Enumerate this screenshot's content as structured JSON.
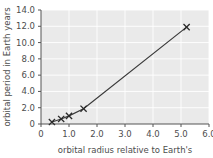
{
  "chart_data": {
    "type": "line",
    "title": "",
    "xlabel": "orbital radius relative to Earth's",
    "ylabel": "orbital period in Earth years",
    "xlim": [
      0,
      6.0
    ],
    "ylim": [
      0,
      14.0
    ],
    "grid": true,
    "legend": "none",
    "marker": "x",
    "x_ticks": [
      0,
      1.0,
      2.0,
      3.0,
      4.0,
      5.0,
      6.0
    ],
    "x_tick_labels": [
      "0",
      "1.0",
      "2.0",
      "3.0",
      "4.0",
      "5.0",
      "6.0"
    ],
    "y_ticks": [
      0,
      2.0,
      4.0,
      6.0,
      8.0,
      10.0,
      12.0,
      14.0
    ],
    "y_tick_labels": [
      "0",
      "2.0",
      "4.0",
      "6.0",
      "8.0",
      "10.0",
      "12.0",
      "14.0"
    ],
    "x": [
      0.39,
      0.72,
      1.0,
      1.52,
      5.2
    ],
    "values": [
      0.24,
      0.62,
      1.0,
      1.88,
      11.9
    ],
    "series": [
      {
        "name": "orbital period vs radius",
        "points": [
          {
            "x": 0.39,
            "y": 0.24
          },
          {
            "x": 0.72,
            "y": 0.62
          },
          {
            "x": 1.0,
            "y": 1.0
          },
          {
            "x": 1.52,
            "y": 1.88
          },
          {
            "x": 5.2,
            "y": 11.9
          }
        ]
      }
    ],
    "colors": {
      "plot_background": "#eaeaea",
      "gridline": "#ffffff",
      "axis": "#555555",
      "data_line": "#3a3a3a",
      "marker": "#2b2b2b",
      "text": "#4d4d4d",
      "page_background": "#ffffff"
    }
  }
}
